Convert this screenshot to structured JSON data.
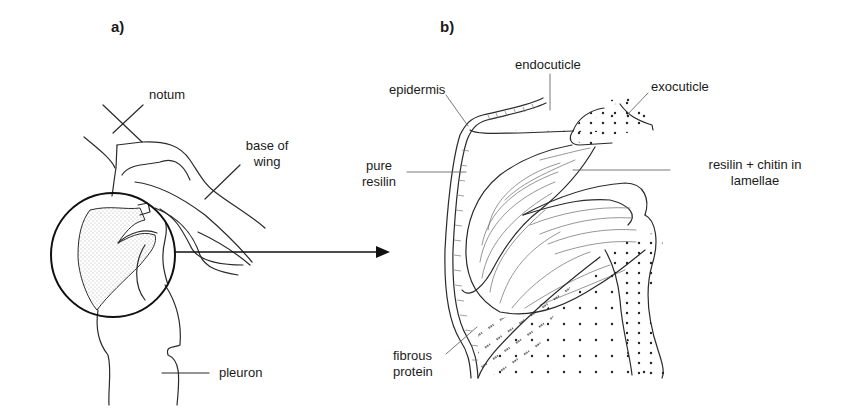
{
  "figure": {
    "panels": [
      {
        "id": "a",
        "label": "a)",
        "annotations": {
          "notum": "notum",
          "base_of_wing_line1": "base of",
          "base_of_wing_line2": "wing",
          "pleuron": "pleuron"
        }
      },
      {
        "id": "b",
        "label": "b)",
        "annotations": {
          "epidermis": "epidermis",
          "endocuticle": "endocuticle",
          "exocuticle": "exocuticle",
          "pure_resilin_line1": "pure",
          "pure_resilin_line2": "resilin",
          "resilin_chitin_line1": "resilin + chitin in",
          "resilin_chitin_line2": "lamellae",
          "fibrous_protein_line1": "fibrous",
          "fibrous_protein_line2": "protein"
        }
      }
    ],
    "connector": "arrow-from-magnified-circle-to-panel-b",
    "colors": {
      "ink": "#1a1a1a",
      "background": "#ffffff"
    }
  }
}
